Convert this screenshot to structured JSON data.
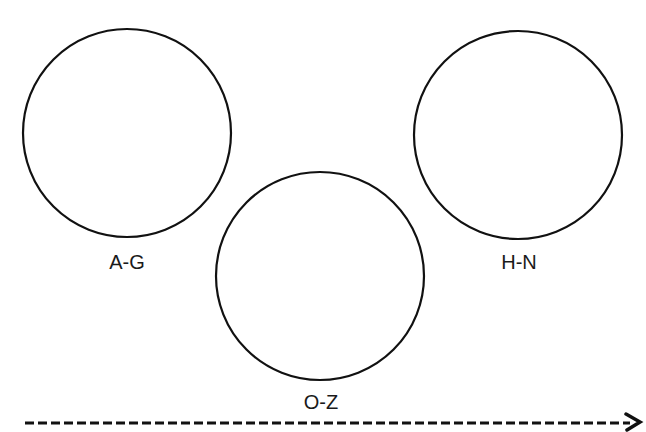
{
  "diagram": {
    "groups": [
      {
        "label": "A-G",
        "cx": 127,
        "cy": 133,
        "r": 104,
        "label_x": 127,
        "label_y": 269
      },
      {
        "label": "H-N",
        "cx": 518,
        "cy": 135,
        "r": 104,
        "label_x": 519,
        "label_y": 269
      },
      {
        "label": "O-Z",
        "cx": 320,
        "cy": 276,
        "r": 104,
        "label_x": 321,
        "label_y": 409
      }
    ],
    "arrow": {
      "x1": 25,
      "y1": 423,
      "x2": 636,
      "y2": 423,
      "style": "dashed",
      "direction": "right"
    },
    "colors": {
      "stroke": "#111111",
      "background": "#ffffff",
      "text": "#1a1a1a"
    }
  }
}
